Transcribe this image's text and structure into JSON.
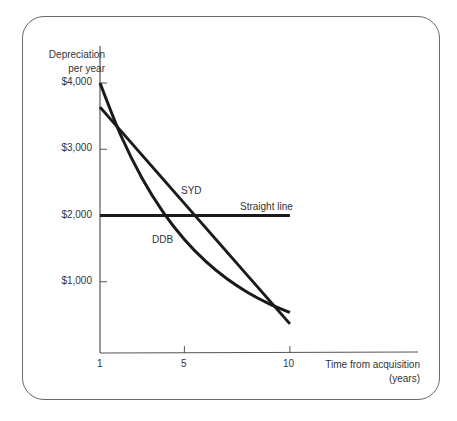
{
  "chart_data": {
    "type": "line",
    "title": "",
    "xlabel": "Time from acquisition (years)",
    "ylabel": "Depreciation per year",
    "xlabel_lines": [
      "Time from acquisition",
      "(years)"
    ],
    "ylabel_lines": [
      "Depreciation",
      "per year"
    ],
    "x_ticks": [
      1,
      5,
      10
    ],
    "y_ticks": [
      "$1,000",
      "$2,000",
      "$3,000",
      "$4,000"
    ],
    "y_tick_values": [
      1000,
      2000,
      3000,
      4000
    ],
    "xlim": [
      1,
      10
    ],
    "ylim": [
      0,
      4000
    ],
    "grid": false,
    "legend_position": "inline labels",
    "x": [
      1,
      2,
      3,
      4,
      5,
      6,
      7,
      8,
      9,
      10
    ],
    "series": [
      {
        "name": "Straight line",
        "values": [
          2000,
          2000,
          2000,
          2000,
          2000,
          2000,
          2000,
          2000,
          2000,
          2000
        ]
      },
      {
        "name": "SYD",
        "values": [
          3636,
          3273,
          2909,
          2545,
          2182,
          1818,
          1455,
          1091,
          727,
          364
        ]
      },
      {
        "name": "DDB",
        "values": [
          4000,
          3200,
          2560,
          2048,
          1638,
          1311,
          1049,
          839,
          671,
          537
        ]
      }
    ]
  },
  "labels": {
    "straight_line": "Straight line",
    "syd": "SYD",
    "ddb": "DDB"
  },
  "colors": {
    "line": "#1a1a1a",
    "axis": "#555555",
    "frame": "#6a6a6a"
  }
}
